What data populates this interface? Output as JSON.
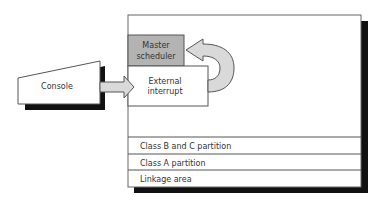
{
  "diagram": {
    "nodes": {
      "console": {
        "label": "Console"
      },
      "master_scheduler": {
        "label_line1": "Master",
        "label_line2": "scheduler",
        "fill": "#b3b3b3"
      },
      "external_interrupt": {
        "label_line1": "External",
        "label_line2": "interrupt"
      }
    },
    "partitions": [
      {
        "label": "Class B and C partition"
      },
      {
        "label": "Class A partition"
      },
      {
        "label": "Linkage area"
      }
    ],
    "edges": [
      {
        "from": "console",
        "to": "external_interrupt",
        "style": "block-arrow"
      },
      {
        "from": "external_interrupt",
        "to": "master_scheduler",
        "style": "curved-block-arrow"
      }
    ],
    "colors": {
      "arrow_fill": "#d9d9d9",
      "shadow": "#111111",
      "outline": "#555555"
    }
  }
}
